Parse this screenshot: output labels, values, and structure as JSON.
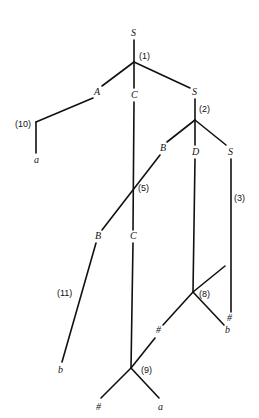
{
  "diagram": {
    "type": "derivation-tree",
    "nodes": [
      {
        "id": "S_root",
        "label": "S",
        "x": 134,
        "y": 36
      },
      {
        "id": "step1_label",
        "label": "(1)",
        "x": 146,
        "y": 59
      },
      {
        "id": "A",
        "label": "A",
        "x": 97,
        "y": 95
      },
      {
        "id": "C1",
        "label": "C",
        "x": 134,
        "y": 98
      },
      {
        "id": "S2",
        "label": "S",
        "x": 195,
        "y": 95
      },
      {
        "id": "step10_label",
        "label": "(10)",
        "x": 27,
        "y": 124
      },
      {
        "id": "a1",
        "label": "a",
        "x": 37,
        "y": 163
      },
      {
        "id": "step2_label",
        "label": "(2)",
        "x": 205,
        "y": 112
      },
      {
        "id": "B1",
        "label": "B",
        "x": 163,
        "y": 151
      },
      {
        "id": "D",
        "label": "D",
        "x": 195,
        "y": 155
      },
      {
        "id": "S3",
        "label": "S",
        "x": 231,
        "y": 155
      },
      {
        "id": "step5_label",
        "label": "(5)",
        "x": 145,
        "y": 191
      },
      {
        "id": "step3_label",
        "label": "(3)",
        "x": 240,
        "y": 201
      },
      {
        "id": "B2",
        "label": "B",
        "x": 98,
        "y": 239
      },
      {
        "id": "C2",
        "label": "C",
        "x": 133,
        "y": 239
      },
      {
        "id": "hash1",
        "label": "#",
        "x": 230,
        "y": 321
      },
      {
        "id": "step11_label",
        "label": "(11)",
        "x": 66,
        "y": 296
      },
      {
        "id": "step8_label",
        "label": "(8)",
        "x": 205,
        "y": 297
      },
      {
        "id": "hash2",
        "label": "#",
        "x": 159,
        "y": 333
      },
      {
        "id": "b2",
        "label": "b",
        "x": 228,
        "y": 333
      },
      {
        "id": "b1",
        "label": "b",
        "x": 61,
        "y": 373
      },
      {
        "id": "step9_label",
        "label": "(9)",
        "x": 146,
        "y": 373
      },
      {
        "id": "hash3",
        "label": "#",
        "x": 99,
        "y": 410
      },
      {
        "id": "a2",
        "label": "a",
        "x": 161,
        "y": 410
      }
    ]
  }
}
